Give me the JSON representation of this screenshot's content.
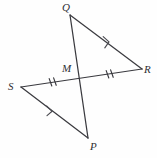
{
  "figure": {
    "background_color": "#fefefe",
    "stroke_color": "#3a3a3f",
    "label_color": "#2e2e33",
    "vertices": [
      {
        "name": "Q",
        "label": "Q",
        "x": 70,
        "y": 15,
        "label_x": 62,
        "label_y": 2
      },
      {
        "name": "R",
        "label": "R",
        "x": 142,
        "y": 69,
        "label_x": 144,
        "label_y": 64
      },
      {
        "name": "S",
        "label": "S",
        "x": 21,
        "y": 87,
        "label_x": 8,
        "label_y": 81
      },
      {
        "name": "P",
        "label": "P",
        "x": 88,
        "y": 138,
        "label_x": 90,
        "label_y": 141
      },
      {
        "name": "M",
        "label": "M",
        "x": 79,
        "y": 78,
        "label_x": 62,
        "label_y": 63
      }
    ],
    "segments": [
      {
        "name": "segment-QR",
        "from": "Q",
        "to": "R",
        "x1": 70,
        "y1": 15,
        "x2": 142,
        "y2": 69
      },
      {
        "name": "segment-QP",
        "from": "Q",
        "to": "P",
        "x1": 70,
        "y1": 15,
        "x2": 88,
        "y2": 138
      },
      {
        "name": "segment-SR",
        "from": "S",
        "to": "R",
        "x1": 21,
        "y1": 87,
        "x2": 142,
        "y2": 69
      },
      {
        "name": "segment-SP",
        "from": "S",
        "to": "P",
        "x1": 21,
        "y1": 87,
        "x2": 88,
        "y2": 138
      }
    ],
    "tick_marks": [
      {
        "name": "tick-SM",
        "on": "segment-SM",
        "count": 2,
        "cx": 53,
        "cy": 82
      },
      {
        "name": "tick-MR",
        "on": "segment-MR",
        "count": 2,
        "cx": 110,
        "cy": 74
      }
    ],
    "parallel_marks": [
      {
        "name": "chevron-QR",
        "on": "segment-QR",
        "count": 1,
        "cx": 108,
        "cy": 41
      },
      {
        "name": "chevron-SP",
        "on": "segment-SP",
        "count": 1,
        "cx": 51,
        "cy": 110
      }
    ]
  }
}
